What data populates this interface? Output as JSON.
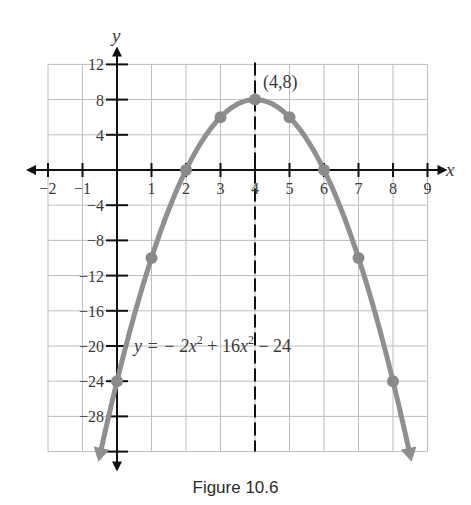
{
  "caption": "Figure 10.6",
  "colors": {
    "grid": "#bdbdbd",
    "axis": "#111111",
    "curve": "#8f8f8f",
    "point": "#8a8a8a",
    "text": "#3a3a3a",
    "dashed": "#111111"
  },
  "chart_data": {
    "type": "line",
    "title": "",
    "xlabel": "x",
    "ylabel": "y",
    "xlim": [
      -2,
      9
    ],
    "ylim": [
      -32,
      12
    ],
    "grid": true,
    "x_ticks": [
      -2,
      -1,
      1,
      2,
      3,
      4,
      5,
      6,
      7,
      8,
      9
    ],
    "x_tick_labels": [
      "−2",
      "−1",
      "1",
      "2",
      "3",
      "4",
      "5",
      "6",
      "7",
      "8",
      "9"
    ],
    "y_ticks": [
      12,
      8,
      4,
      -4,
      -8,
      -12,
      -16,
      -20,
      -24,
      -28
    ],
    "y_tick_labels": [
      "12",
      "8",
      "4",
      "−4",
      "−8",
      "−12",
      "−16",
      "−20",
      "−24",
      "−28"
    ],
    "equation_label": "y = − 2x² + 16x² − 24",
    "equation_parts": {
      "lhs": "y = − 2",
      "x1": "x",
      "exp1": "2",
      "mid": " + 16",
      "x2": "x",
      "exp2": "2",
      "rhs": " − 24"
    },
    "axis_of_symmetry": 4,
    "vertex": {
      "x": 4,
      "y": 8,
      "label": "(4,8)"
    },
    "series": [
      {
        "name": "y = -2x^2 + 16x - 24",
        "points": [
          {
            "x": 0,
            "y": -24
          },
          {
            "x": 1,
            "y": -10
          },
          {
            "x": 2,
            "y": 0
          },
          {
            "x": 3,
            "y": 6
          },
          {
            "x": 4,
            "y": 8
          },
          {
            "x": 5,
            "y": 6
          },
          {
            "x": 6,
            "y": 0
          },
          {
            "x": 7,
            "y": -10
          },
          {
            "x": 8,
            "y": -24
          }
        ],
        "curve_domain": [
          -0.45,
          8.45
        ]
      }
    ]
  }
}
